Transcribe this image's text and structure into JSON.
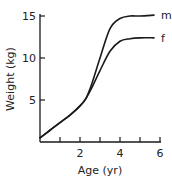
{
  "chart_data": {
    "type": "line",
    "title": "",
    "xlabel": "Age (yr)",
    "ylabel": "Weight (kg)",
    "xlim": [
      0,
      6
    ],
    "ylim": [
      0,
      15
    ],
    "xticks": [
      0,
      1,
      2,
      3,
      4,
      5,
      6
    ],
    "xtick_labels": [
      "2",
      "4",
      "6"
    ],
    "xtick_label_values": [
      2,
      4,
      6
    ],
    "yticks": [
      5,
      10,
      15
    ],
    "ytick_labels": [
      "5",
      "10",
      "15"
    ],
    "grid": false,
    "legend": "inline labels at line ends",
    "series": [
      {
        "name": "m",
        "x": [
          0,
          0.5,
          1,
          1.5,
          2,
          2.3,
          2.6,
          3,
          3.5,
          4,
          4.5,
          5,
          5.7
        ],
        "y": [
          0.5,
          1.4,
          2.3,
          3.2,
          4.3,
          5.2,
          7.0,
          10.0,
          13.5,
          14.7,
          15.0,
          15.0,
          15.1
        ]
      },
      {
        "name": "f",
        "x": [
          0,
          0.5,
          1,
          1.5,
          2,
          2.3,
          2.6,
          3,
          3.5,
          4,
          4.5,
          5,
          5.7
        ],
        "y": [
          0.5,
          1.4,
          2.3,
          3.2,
          4.3,
          5.2,
          6.5,
          8.5,
          10.8,
          12.0,
          12.3,
          12.4,
          12.4
        ]
      }
    ]
  }
}
